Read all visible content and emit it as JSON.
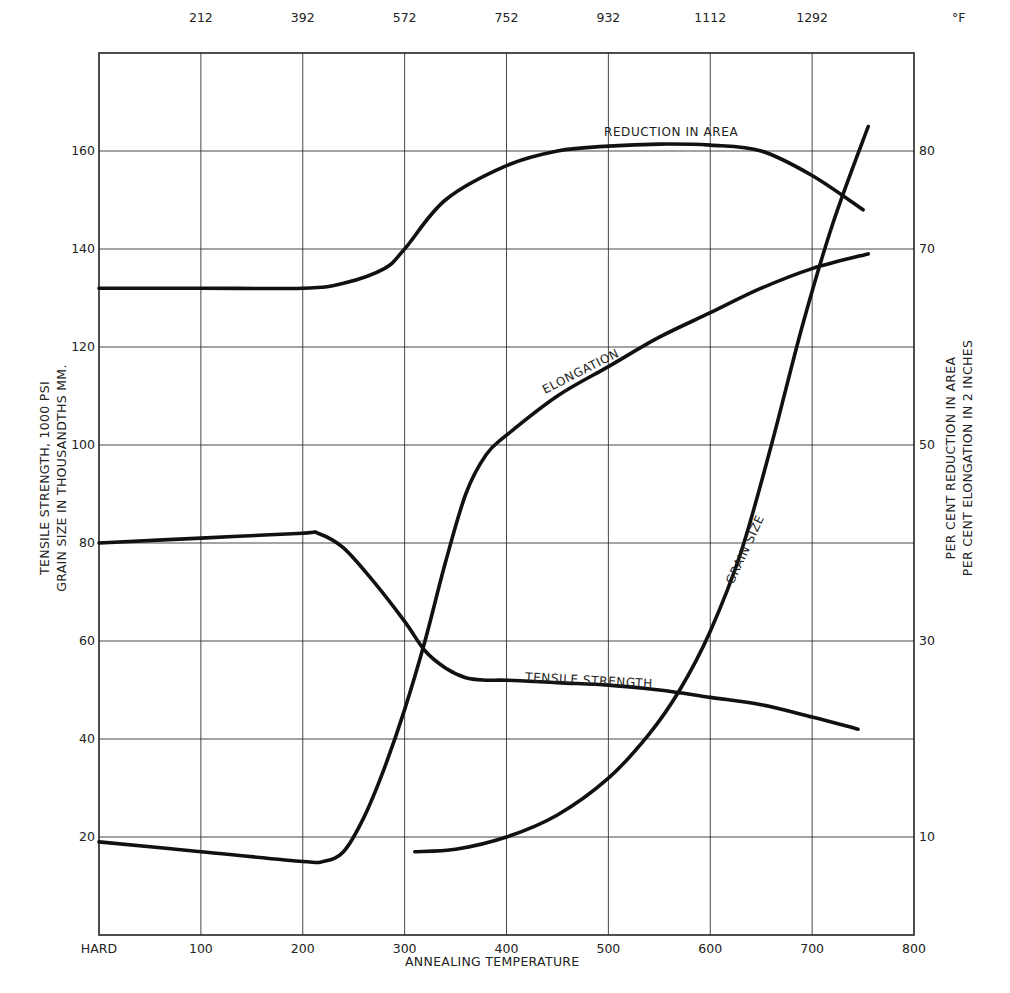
{
  "chart_data": {
    "type": "line",
    "title": "",
    "xlabel": "ANNEALING TEMPERATURE",
    "x_unit_bottom": "°C",
    "x_top_unit": "°F",
    "ylabel_left": [
      "TENSILE STRENGTH, 1000 PSI",
      "GRAIN SIZE IN THOUSANDTHS MM."
    ],
    "ylabel_right": [
      "PER CENT REDUCTION IN AREA",
      "PER CENT ELONGATION IN 2 INCHES"
    ],
    "xlim": [
      0,
      800
    ],
    "ylim_left": [
      0,
      180
    ],
    "ylim_right": [
      0,
      90
    ],
    "grid": true,
    "legend": "none (curves labeled inline)",
    "x_ticks_bottom": [
      {
        "value": 0,
        "label": "HARD"
      },
      {
        "value": 100,
        "label": "100"
      },
      {
        "value": 200,
        "label": "200"
      },
      {
        "value": 300,
        "label": "300"
      },
      {
        "value": 400,
        "label": "400"
      },
      {
        "value": 500,
        "label": "500"
      },
      {
        "value": 600,
        "label": "600"
      },
      {
        "value": 700,
        "label": "700"
      },
      {
        "value": 800,
        "label": "800"
      }
    ],
    "x_ticks_top": [
      {
        "value": 100,
        "label": "212"
      },
      {
        "value": 200,
        "label": "392"
      },
      {
        "value": 300,
        "label": "572"
      },
      {
        "value": 400,
        "label": "752"
      },
      {
        "value": 500,
        "label": "932"
      },
      {
        "value": 600,
        "label": "1112"
      },
      {
        "value": 700,
        "label": "1292"
      }
    ],
    "y_ticks_left": [
      {
        "value": 20,
        "label": "20"
      },
      {
        "value": 40,
        "label": "40"
      },
      {
        "value": 60,
        "label": "60"
      },
      {
        "value": 80,
        "label": "80"
      },
      {
        "value": 100,
        "label": "100"
      },
      {
        "value": 120,
        "label": "120"
      },
      {
        "value": 140,
        "label": "140"
      },
      {
        "value": 160,
        "label": "160"
      }
    ],
    "y_ticks_right": [
      {
        "value": 10,
        "label": "10"
      },
      {
        "value": 30,
        "label": "30"
      },
      {
        "value": 50,
        "label": "50"
      },
      {
        "value": 70,
        "label": "70"
      },
      {
        "value": 80,
        "label": "80"
      }
    ],
    "series": [
      {
        "name": "REDUCTION IN AREA",
        "axis": "right",
        "x": [
          0,
          100,
          200,
          240,
          280,
          300,
          340,
          400,
          450,
          500,
          550,
          600,
          650,
          700,
          750
        ],
        "y": [
          66,
          66,
          66,
          66.5,
          68,
          70,
          75,
          78.5,
          80,
          80.5,
          80.7,
          80.6,
          80,
          77.5,
          74
        ]
      },
      {
        "name": "ELONGATION",
        "axis": "right",
        "x": [
          0,
          100,
          200,
          220,
          240,
          260,
          280,
          300,
          320,
          340,
          360,
          380,
          400,
          450,
          500,
          550,
          600,
          650,
          700,
          755
        ],
        "y": [
          9.5,
          8.5,
          7.5,
          7.5,
          8.5,
          12,
          17,
          23,
          30,
          38,
          45,
          49,
          51,
          55,
          58,
          61,
          63.5,
          66,
          68,
          69.5
        ]
      },
      {
        "name": "TENSILE STRENGTH",
        "axis": "left",
        "x": [
          0,
          100,
          200,
          215,
          240,
          270,
          300,
          320,
          340,
          360,
          380,
          400,
          450,
          500,
          550,
          600,
          650,
          700,
          745
        ],
        "y": [
          80,
          81,
          82,
          82,
          79,
          72,
          64,
          58,
          54.5,
          52.5,
          52,
          52,
          51.5,
          51,
          50,
          48.5,
          47,
          44.5,
          42
        ]
      },
      {
        "name": "GRAIN SIZE",
        "axis": "left",
        "x": [
          310,
          350,
          400,
          450,
          500,
          540,
          570,
          600,
          630,
          660,
          690,
          720,
          755
        ],
        "y": [
          17,
          17.5,
          20,
          24.5,
          32,
          41,
          50,
          62,
          78,
          100,
          124,
          145,
          165
        ]
      }
    ],
    "annotations": [
      {
        "text": "REDUCTION IN AREA",
        "near_series": "REDUCTION IN AREA"
      },
      {
        "text": "ELONGATION",
        "near_series": "ELONGATION"
      },
      {
        "text": "TENSILE STRENGTH",
        "near_series": "TENSILE STRENGTH"
      },
      {
        "text": "GRAIN SIZE",
        "near_series": "GRAIN SIZE"
      }
    ]
  },
  "labels": {
    "top_unit": "°F",
    "xlabel": "ANNEALING TEMPERATURE",
    "ylabel_left_1": "TENSILE STRENGTH, 1000 PSI",
    "ylabel_left_2": "GRAIN SIZE IN THOUSANDTHS MM.",
    "ylabel_right_1": "PER CENT REDUCTION IN AREA",
    "ylabel_right_2": "PER CENT ELONGATION IN 2 INCHES",
    "curve_reduction": "REDUCTION IN AREA",
    "curve_elongation": "ELONGATION",
    "curve_tensile": "TENSILE STRENGTH",
    "curve_grain": "GRAIN SIZE"
  },
  "colors": {
    "ink": "#111111",
    "grid": "#333333",
    "background": "#ffffff"
  }
}
